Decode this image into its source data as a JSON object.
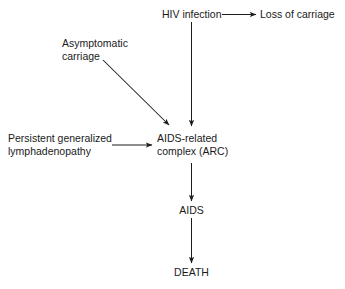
{
  "diagram": {
    "background_color": "#ffffff",
    "line_color": "#1d1d1d",
    "text_color": "#1a1a1a",
    "nodes": [
      {
        "id": "hiv-infection",
        "label": "HIV infection",
        "lines": [
          "HIV infection"
        ]
      },
      {
        "id": "loss-of-carriage",
        "label": "Loss of carriage",
        "lines": [
          "Loss of carriage"
        ]
      },
      {
        "id": "asymptomatic-carriage",
        "label": "Asymptomatic carriage",
        "lines": [
          "Asymptomatic",
          "carriage"
        ]
      },
      {
        "id": "persistent-generalized-lymphadenopathy",
        "label": "Persistent generalized lymphadenopathy",
        "lines": [
          "Persistent generalized",
          "lymphadenopathy"
        ]
      },
      {
        "id": "aids-related-complex",
        "label": "AIDS-related complex (ARC)",
        "lines": [
          "AIDS-related",
          "complex (ARC)"
        ]
      },
      {
        "id": "aids",
        "label": "AIDS",
        "lines": [
          "AIDS"
        ]
      },
      {
        "id": "death",
        "label": "DEATH",
        "lines": [
          "DEATH"
        ]
      }
    ],
    "edges": [
      {
        "id": "hiv-to-loss",
        "from": "hiv-infection",
        "to": "loss-of-carriage",
        "direction": "right"
      },
      {
        "id": "hiv-to-arc",
        "from": "hiv-infection",
        "to": "aids-related-complex",
        "direction": "down"
      },
      {
        "id": "asymptomatic-to-arc",
        "from": "asymptomatic-carriage",
        "to": "aids-related-complex",
        "direction": "diagonal-down-right"
      },
      {
        "id": "pgl-to-arc",
        "from": "persistent-generalized-lymphadenopathy",
        "to": "aids-related-complex",
        "direction": "right"
      },
      {
        "id": "arc-to-aids",
        "from": "aids-related-complex",
        "to": "aids",
        "direction": "down"
      },
      {
        "id": "aids-to-death",
        "from": "aids",
        "to": "death",
        "direction": "down"
      }
    ]
  }
}
